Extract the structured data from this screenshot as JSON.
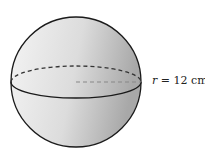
{
  "figure": {
    "shape": "sphere",
    "radius_label": "r = 12 cm",
    "radius_var": "r",
    "radius_rest": " = 12 cm",
    "colors": {
      "stroke": "#1a1a1a",
      "fill_light": "#f2f2f2",
      "fill_dark": "#b8b8b8",
      "radius_dash": "#888888"
    }
  }
}
